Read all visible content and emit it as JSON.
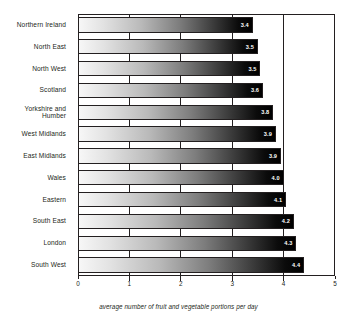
{
  "chart_data": {
    "type": "bar",
    "orientation": "horizontal",
    "title": "",
    "xlabel": "average number of fruit and vegetable portions per day",
    "ylabel": "",
    "xlim": [
      0,
      5
    ],
    "xticks": [
      "0",
      "1",
      "2",
      "3",
      "4",
      "5"
    ],
    "grid": true,
    "legend": null,
    "categories": [
      "Northern Ireland",
      "North East",
      "North West",
      "Scotland",
      "Yorkshire and Humber",
      "West Midlands",
      "East Midlands",
      "Wales",
      "Eastern",
      "South East",
      "London",
      "South West"
    ],
    "values": [
      3.4,
      3.5,
      3.55,
      3.6,
      3.8,
      3.85,
      3.95,
      4.0,
      4.05,
      4.2,
      4.25,
      4.4
    ],
    "value_labels": [
      "3.4",
      "3.5",
      "3.5",
      "3.6",
      "3.8",
      "3.9",
      "3.9",
      "4.0",
      "4.1",
      "4.2",
      "4.3",
      "4.4"
    ]
  },
  "axis": {
    "caption": "average number of fruit and vegetable portions per day"
  },
  "colors": {
    "axis": "#231f20",
    "bar_start": "#f7f7f7",
    "bar_end": "#000000",
    "value_text": "#ffffff",
    "background": "#ffffff"
  }
}
